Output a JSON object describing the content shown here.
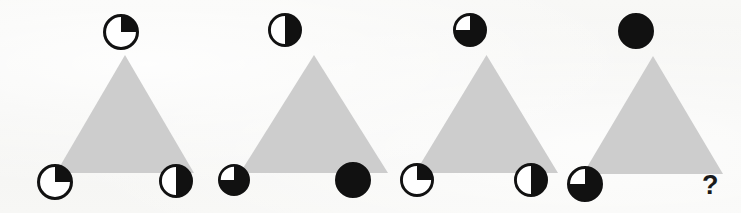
{
  "puzzle": {
    "type": "visual-analogy-matrix",
    "background_color": "#f7f7f5",
    "triangle_color": "#cdcdcd",
    "shape_color": "#111111",
    "question_label": "?",
    "panels": [
      {
        "id": "panel-1",
        "shape": "triangle",
        "vertices": [
          {
            "position": "top",
            "icon": "pie-circle-25",
            "fill_percent": 25,
            "fill_start": "12-oclock",
            "direction": "clockwise"
          },
          {
            "position": "bottom-left",
            "icon": "pie-circle-25",
            "fill_percent": 25,
            "fill_start": "12-oclock",
            "direction": "clockwise"
          },
          {
            "position": "bottom-right",
            "icon": "pie-circle-50",
            "fill_percent": 50,
            "fill_start": "12-oclock",
            "direction": "clockwise"
          }
        ]
      },
      {
        "id": "panel-2",
        "shape": "triangle",
        "vertices": [
          {
            "position": "top",
            "icon": "pie-circle-50",
            "fill_percent": 50,
            "fill_start": "12-oclock",
            "direction": "clockwise"
          },
          {
            "position": "bottom-left",
            "icon": "pie-circle-75",
            "fill_percent": 75,
            "fill_start": "12-oclock",
            "direction": "clockwise"
          },
          {
            "position": "bottom-right",
            "icon": "pie-circle-100",
            "fill_percent": 100,
            "fill_start": "12-oclock",
            "direction": "clockwise"
          }
        ]
      },
      {
        "id": "panel-3",
        "shape": "triangle",
        "vertices": [
          {
            "position": "top",
            "icon": "pie-circle-75",
            "fill_percent": 75,
            "fill_start": "12-oclock",
            "direction": "clockwise"
          },
          {
            "position": "bottom-left",
            "icon": "pie-circle-25",
            "fill_percent": 25,
            "fill_start": "12-oclock",
            "direction": "clockwise"
          },
          {
            "position": "bottom-right",
            "icon": "pie-circle-50",
            "fill_percent": 50,
            "fill_start": "12-oclock",
            "direction": "clockwise"
          }
        ]
      },
      {
        "id": "panel-4",
        "shape": "triangle",
        "vertices": [
          {
            "position": "top",
            "icon": "pie-circle-100",
            "fill_percent": 100,
            "fill_start": "12-oclock",
            "direction": "clockwise"
          },
          {
            "position": "bottom-left",
            "icon": "pie-circle-75",
            "fill_percent": 75,
            "fill_start": "12-oclock",
            "direction": "clockwise"
          },
          {
            "position": "bottom-right",
            "icon": "question-mark",
            "fill_percent": null,
            "label": "?"
          }
        ]
      }
    ]
  }
}
